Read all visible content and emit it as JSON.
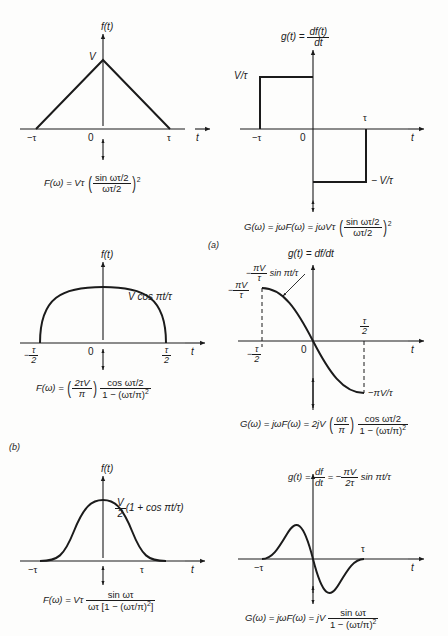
{
  "figure": {
    "background": "#fdfdfc",
    "ink": "#1b1b1b",
    "panel_labels": [
      "(a)",
      "(b)"
    ]
  },
  "rows": [
    {
      "id": "row-a",
      "panel_label": "(a)",
      "left": {
        "axis_y_label": "f(t)",
        "axis_x_label": "t",
        "origin_label": "0",
        "x_ticks": [
          "−τ",
          "τ"
        ],
        "y_value_label": "V",
        "waveform": "triangular-pulse",
        "equation": {
          "lhs": "F(ω) =",
          "coef": "Vτ",
          "num": "sin ωτ/2",
          "den": "ωτ/2",
          "exp": "2"
        }
      },
      "right": {
        "axis_y_label_main": "g(t) =",
        "axis_y_label_num": "df(t)",
        "axis_y_label_den": "dt",
        "axis_x_label": "t",
        "origin_label": "0",
        "x_ticks": [
          "−τ",
          "τ"
        ],
        "y_pos_label": "V/τ",
        "y_neg_label": "− V/τ",
        "waveform": "rectangular-doublet",
        "equation": {
          "lhs": "G(ω) = jωF(ω) = jωVτ",
          "num": "sin ωτ/2",
          "den": "ωτ/2",
          "exp": "2"
        }
      }
    },
    {
      "id": "row-b",
      "panel_label": "(b)",
      "left": {
        "axis_y_label": "f(t)",
        "axis_x_label": "t",
        "origin_label": "0",
        "x_tick_neg_num": "τ",
        "x_tick_neg_den": "2",
        "x_tick_neg_sign": "−",
        "x_tick_pos_num": "τ",
        "x_tick_pos_den": "2",
        "curve_label": "V cos πt/τ",
        "waveform": "cosine-arch",
        "equation": {
          "lhs": "F(ω) =",
          "coef_num": "2τV",
          "coef_den": "π",
          "num": "cos ωτ/2",
          "den": "1 − (ωτ/π)",
          "den_exp": "2"
        }
      },
      "right": {
        "axis_y_label": "g(t) = df/dt",
        "axis_x_label": "t",
        "origin_label": "0",
        "x_tick_neg_num": "τ",
        "x_tick_neg_den": "2",
        "x_tick_neg_sign": "−",
        "x_tick_pos_num": "τ",
        "x_tick_pos_den": "2",
        "y_label_sign": "−",
        "y_label_num": "πV",
        "y_label_den": "τ",
        "curve_label_sign": "−",
        "curve_label_num": "πV",
        "curve_label_den": "τ",
        "curve_label_tail": "sin πt/τ",
        "bottom_value_label": "−πV/τ",
        "waveform": "negative-sine",
        "equation": {
          "lhs": "G(ω) = jωF(ω) = 2jV",
          "coef_num": "ωτ",
          "coef_den": "π",
          "num": "cos ωτ/2",
          "den": "1 − (ωτ/π)",
          "den_exp": "2"
        }
      }
    },
    {
      "id": "row-c",
      "panel_label": "",
      "left": {
        "axis_y_label": "f(t)",
        "axis_x_label": "t",
        "origin_label": "",
        "x_ticks": [
          "−τ",
          "τ"
        ],
        "curve_label_num": "V",
        "curve_label_den": "2",
        "curve_label_tail": "(1 + cos πt/τ)",
        "waveform": "raised-cosine",
        "equation": {
          "lhs": "F(ω) = Vτ",
          "num": "sin ωτ",
          "den": "ωτ [1 − (ωτ/π)",
          "den_exp": "2",
          "den_tail": "]"
        }
      },
      "right": {
        "axis_label_lhs": "g(t) =",
        "axis_label_num1": "df",
        "axis_label_den1": "dt",
        "axis_label_mid": "= −",
        "axis_label_num2": "πV",
        "axis_label_den2": "2τ",
        "axis_label_tail": "sin πt/τ",
        "axis_x_label": "t",
        "x_ticks": [
          "−τ",
          "τ"
        ],
        "waveform": "full-sine",
        "equation": {
          "lhs": "G(ω) = jωF(ω) = jV",
          "num": "sin ωτ",
          "den": "1 − (ωτ/π)",
          "den_exp": "2"
        }
      }
    }
  ]
}
